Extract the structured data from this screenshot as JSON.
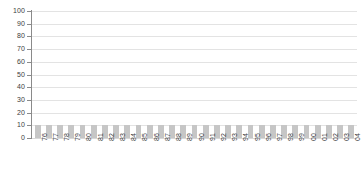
{
  "chart_data": {
    "type": "bar",
    "title": "",
    "subtitle": "",
    "xlabel": "",
    "ylabel": "",
    "categories": [
      "76",
      "77",
      "78",
      "79",
      "80",
      "81",
      "82",
      "83",
      "84",
      "85",
      "86",
      "87",
      "88",
      "89",
      "90",
      "91",
      "92",
      "93",
      "94",
      "95",
      "96",
      "97",
      "98",
      "99",
      "00",
      "01",
      "02",
      "03",
      "04"
    ],
    "values": [
      10,
      10,
      10,
      10,
      10,
      10,
      10,
      10,
      10,
      10,
      10,
      10,
      10,
      10,
      10,
      10,
      10,
      10,
      10,
      10,
      10,
      10,
      10,
      10,
      10,
      10,
      10,
      10,
      10
    ],
    "ylim": [
      0,
      100
    ],
    "ytick_labels": [
      "100",
      "90",
      "80",
      "70",
      "60",
      "50",
      "40",
      "30",
      "20",
      "10",
      "0"
    ],
    "ytick_values": [
      100,
      90,
      80,
      70,
      60,
      50,
      40,
      30,
      20,
      10,
      0
    ],
    "grid": true,
    "legend": null,
    "legend_position": "none",
    "annotations": [],
    "series": [
      {
        "name": "",
        "values": [
          10,
          10,
          10,
          10,
          10,
          10,
          10,
          10,
          10,
          10,
          10,
          10,
          10,
          10,
          10,
          10,
          10,
          10,
          10,
          10,
          10,
          10,
          10,
          10,
          10,
          10,
          10,
          10,
          10
        ],
        "color": "#c6c6c6"
      }
    ]
  },
  "style": {
    "bar_color": "#c6c6c6",
    "gridline_color": "#e3e3e3",
    "axis_color": "#8a8a8a",
    "text_color": "#3d3d3d",
    "background": "#ffffff"
  }
}
